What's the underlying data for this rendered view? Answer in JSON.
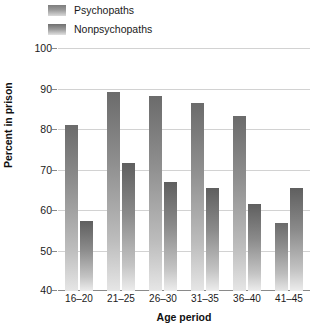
{
  "chart_data": {
    "type": "bar",
    "title": "",
    "xlabel": "Age period",
    "ylabel": "Percent in prison",
    "categories": [
      "16–20",
      "21–25",
      "26–30",
      "31–35",
      "36–40",
      "41–45"
    ],
    "ylim": [
      40,
      100
    ],
    "yticks": [
      40,
      50,
      60,
      70,
      80,
      90,
      100
    ],
    "ytick_labels": [
      "40",
      "50",
      "60",
      "70",
      "80",
      "90",
      "100"
    ],
    "grid": true,
    "legend_position": "top-left",
    "series": [
      {
        "name": "Psychopaths",
        "color": "#8e8e8e",
        "values": [
          81.0,
          89.2,
          88.2,
          86.5,
          83.3,
          56.8
        ]
      },
      {
        "name": "Nonpsychopaths",
        "color": "#8a8a8a",
        "values": [
          57.3,
          71.7,
          67.0,
          65.4,
          61.5,
          65.5
        ]
      }
    ]
  },
  "legend": {
    "items": [
      {
        "label": "Psychopaths"
      },
      {
        "label": "Nonpsychopaths"
      }
    ]
  }
}
